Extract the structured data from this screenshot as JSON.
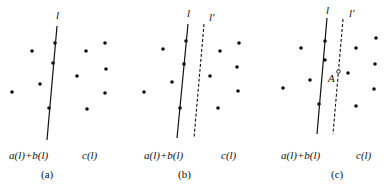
{
  "panels": [
    {
      "caption": "(a)",
      "left_label": "a(l)+b(l)",
      "right_label": "c(l)",
      "line_label": "l",
      "line_prime_label": null
    },
    {
      "caption": "(b)",
      "left_label": "a(l)+b(l)",
      "right_label": "c(l)",
      "line_label": "l",
      "line_prime_label": "l′"
    },
    {
      "caption": "(c)",
      "left_label": "a(l)+b(l)",
      "right_label": "c(l)",
      "line_label": "l",
      "line_prime_label": "l′",
      "point_label": "A"
    }
  ]
}
